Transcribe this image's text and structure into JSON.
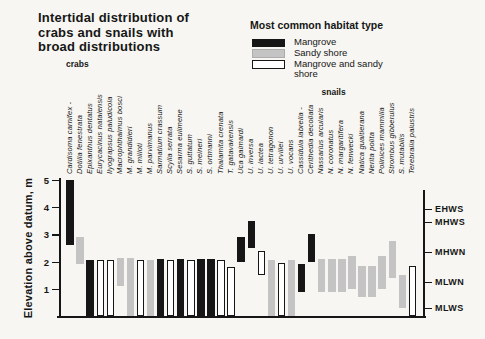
{
  "page_background": "#f7f6f2",
  "title": {
    "lines": [
      "Intertidal distribution of",
      "crabs and snails with",
      "broad distributions"
    ]
  },
  "legend": {
    "title": "Most common habitat type",
    "items": [
      {
        "label": "Mangrove",
        "habitat": "mangrove",
        "color": "#161616"
      },
      {
        "label": "Sandy shore",
        "habitat": "sandy",
        "color": "#c4c4c4"
      },
      {
        "label": "Mangrove and sandy shore",
        "habitat": "both",
        "color": "#ffffff"
      }
    ]
  },
  "chart_data": {
    "type": "bar",
    "subtype": "vertical-range-bars",
    "title": "Intertidal distribution of crabs and snails with broad distributions",
    "xlabel": "",
    "ylabel": "Elevation above datum, m",
    "ylim": [
      0,
      5
    ],
    "yticks": [
      1,
      2,
      3,
      4,
      5
    ],
    "grid": false,
    "legend_position": "top-right",
    "group_labels": [
      {
        "label": "crabs",
        "first_species_index": 0
      },
      {
        "label": "snails",
        "first_species_index": 23
      }
    ],
    "tide_levels": [
      {
        "label": "EHWS",
        "elevation": 3.95
      },
      {
        "label": "MHWS",
        "elevation": 3.45
      },
      {
        "label": "MHWN",
        "elevation": 2.35
      },
      {
        "label": "MLWN",
        "elevation": 1.25
      },
      {
        "label": "MLWS",
        "elevation": 0.3
      }
    ],
    "series": [
      {
        "name": "Cardisoma carnifex -",
        "group": "crabs",
        "habitat": "mangrove",
        "range": [
          2.6,
          5.0
        ]
      },
      {
        "name": "Dotilla fenestrata",
        "group": "crabs",
        "habitat": "sandy",
        "range": [
          1.9,
          2.9
        ]
      },
      {
        "name": "Epixanthus dentatus",
        "group": "crabs",
        "habitat": "mangrove",
        "range": [
          0,
          2.05
        ]
      },
      {
        "name": "Eurycacinus natalensis",
        "group": "crabs",
        "habitat": "both",
        "range": [
          0,
          2.05
        ]
      },
      {
        "name": "Ilyograpsus paludicola",
        "group": "crabs",
        "habitat": "both",
        "range": [
          0,
          2.05
        ]
      },
      {
        "name": "Macrophthalmus bosci",
        "group": "crabs",
        "habitat": "sandy",
        "range": [
          1.1,
          2.15
        ]
      },
      {
        "name": "M. grandidieri",
        "group": "crabs",
        "habitat": "sandy",
        "range": [
          0,
          2.15
        ]
      },
      {
        "name": "M. milloti",
        "group": "crabs",
        "habitat": "both",
        "range": [
          0,
          2.05
        ]
      },
      {
        "name": "M. parvimanus",
        "group": "crabs",
        "habitat": "sandy",
        "range": [
          0,
          2.05
        ]
      },
      {
        "name": "Sarmatium crassum",
        "group": "crabs",
        "habitat": "mangrove",
        "range": [
          0,
          2.1
        ]
      },
      {
        "name": "Scylla serrata",
        "group": "crabs",
        "habitat": "both",
        "range": [
          0,
          2.05
        ]
      },
      {
        "name": "Sesarma eulimene",
        "group": "crabs",
        "habitat": "mangrove",
        "range": [
          0,
          2.1
        ]
      },
      {
        "name": "S. guttatum",
        "group": "crabs",
        "habitat": "both",
        "range": [
          0,
          2.05
        ]
      },
      {
        "name": "S. meineri",
        "group": "crabs",
        "habitat": "mangrove",
        "range": [
          0,
          2.1
        ]
      },
      {
        "name": "S. ortmanni",
        "group": "crabs",
        "habitat": "mangrove",
        "range": [
          0,
          2.1
        ]
      },
      {
        "name": "Thalamita crenata",
        "group": "crabs",
        "habitat": "both",
        "range": [
          0,
          2.05
        ]
      },
      {
        "name": "T. gatavakensis",
        "group": "crabs",
        "habitat": "both",
        "range": [
          0,
          1.8
        ]
      },
      {
        "name": "Uca gaimardi",
        "group": "crabs",
        "habitat": "mangrove",
        "range": [
          2.0,
          2.9
        ]
      },
      {
        "name": "U. inversa",
        "group": "crabs",
        "habitat": "mangrove",
        "range": [
          2.5,
          3.5
        ]
      },
      {
        "name": "U. lactea",
        "group": "crabs",
        "habitat": "both",
        "range": [
          1.5,
          2.4
        ]
      },
      {
        "name": "U. tetragonon",
        "group": "crabs",
        "habitat": "sandy",
        "range": [
          0,
          2.05
        ]
      },
      {
        "name": "U. urvillei",
        "group": "crabs",
        "habitat": "both",
        "range": [
          0,
          1.95
        ]
      },
      {
        "name": "U. vocans",
        "group": "crabs",
        "habitat": "sandy",
        "range": [
          0,
          2.05
        ]
      },
      {
        "name": "Cassidula labrella -",
        "group": "snails",
        "habitat": "mangrove",
        "range": [
          0.9,
          1.9
        ]
      },
      {
        "name": "Cerithedia decollata",
        "group": "snails",
        "habitat": "mangrove",
        "range": [
          2.0,
          3.0
        ]
      },
      {
        "name": "Nassarius arcularis",
        "group": "snails",
        "habitat": "sandy",
        "range": [
          0.9,
          2.1
        ]
      },
      {
        "name": "N. coronatus",
        "group": "snails",
        "habitat": "sandy",
        "range": [
          0.9,
          2.1
        ]
      },
      {
        "name": "N. margaritifera",
        "group": "snails",
        "habitat": "sandy",
        "range": [
          0.9,
          2.1
        ]
      },
      {
        "name": "N. fenwecki",
        "group": "snails",
        "habitat": "sandy",
        "range": [
          1.0,
          2.2
        ]
      },
      {
        "name": "Natica gualtierana",
        "group": "snails",
        "habitat": "sandy",
        "range": [
          0.7,
          1.85
        ]
      },
      {
        "name": "Nerita polita",
        "group": "snails",
        "habitat": "sandy",
        "range": [
          0.7,
          1.85
        ]
      },
      {
        "name": "Polinices mammilla",
        "group": "snails",
        "habitat": "sandy",
        "range": [
          1.0,
          2.2
        ]
      },
      {
        "name": "Strombus gibberulus",
        "group": "snails",
        "habitat": "sandy",
        "range": [
          1.4,
          2.75
        ]
      },
      {
        "name": "S. mutabilis",
        "group": "snails",
        "habitat": "sandy",
        "range": [
          0.3,
          1.5
        ]
      },
      {
        "name": "Terebralia palustris",
        "group": "snails",
        "habitat": "both",
        "range": [
          0,
          1.85
        ]
      }
    ]
  }
}
